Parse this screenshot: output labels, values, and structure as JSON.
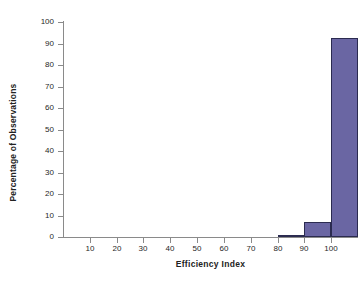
{
  "chart_data": {
    "type": "bar",
    "title": "",
    "subtitle": "",
    "xlabel": "Efficiency Index",
    "ylabel": "Percentage of Observations",
    "xlim": [
      0,
      110
    ],
    "ylim": [
      0,
      100
    ],
    "grid": false,
    "legend": false,
    "legend_position": "none",
    "bin_width": 10,
    "x_ticks": [
      10,
      20,
      30,
      40,
      50,
      60,
      70,
      80,
      90,
      100
    ],
    "y_ticks": [
      0,
      10,
      20,
      30,
      40,
      50,
      60,
      70,
      80,
      90,
      100
    ],
    "categories": [
      "0-10",
      "10-20",
      "20-30",
      "30-40",
      "40-50",
      "50-60",
      "60-70",
      "70-80",
      "80-90",
      "90-100",
      "100-110"
    ],
    "bin_starts": [
      0,
      10,
      20,
      30,
      40,
      50,
      60,
      70,
      80,
      90,
      100
    ],
    "values": [
      0,
      0,
      0,
      0,
      0,
      0,
      0,
      0,
      1,
      7,
      92.5
    ],
    "series": [
      {
        "name": "Percentage of Observations",
        "values": [
          0,
          0,
          0,
          0,
          0,
          0,
          0,
          0,
          1,
          7,
          92.5
        ]
      }
    ],
    "colors": {
      "bar_fill": "#6a66a3",
      "bar_border": "#2b2b50",
      "axis": "#8a8a8a",
      "text": "#1f1f1f",
      "background": "#ffffff"
    }
  },
  "axes": {
    "y_title": "Percentage of Observations",
    "x_title": "Efficiency Index",
    "y_tick_labels": [
      "100",
      "90",
      "80",
      "70",
      "60",
      "50",
      "40",
      "30",
      "20",
      "10",
      "0"
    ],
    "x_tick_labels": [
      "10",
      "20",
      "30",
      "40",
      "50",
      "60",
      "70",
      "80",
      "90",
      "100"
    ]
  }
}
